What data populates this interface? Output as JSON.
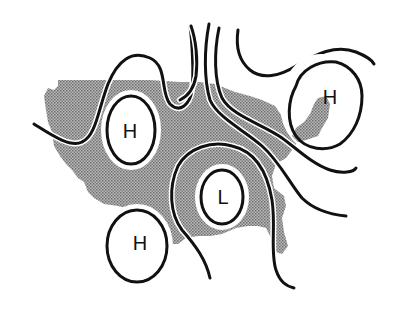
{
  "map": {
    "subject": "United States weather map with isobars",
    "land_color": "#9a9a9a",
    "line_color": "#111111",
    "background": "#ffffff",
    "pressure_systems": [
      {
        "id": "high-northwest",
        "label": "H",
        "type": "high",
        "cx": 131,
        "cy": 130,
        "rx": 23,
        "ry": 33
      },
      {
        "id": "high-northeast",
        "label": "H",
        "type": "high",
        "cx": 321,
        "cy": 104,
        "rx": 38,
        "ry": 47
      },
      {
        "id": "low-central",
        "label": "L",
        "type": "low",
        "cx": 222,
        "cy": 196,
        "rx": 21,
        "ry": 27
      },
      {
        "id": "high-southwest",
        "label": "H",
        "type": "high",
        "cx": 137,
        "cy": 243,
        "rx": 30,
        "ry": 36
      }
    ],
    "isobar_count": 6
  }
}
